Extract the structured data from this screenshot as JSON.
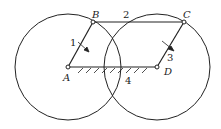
{
  "diagram": {
    "type": "four-bar linkage (parallelogram) with circles",
    "points": {
      "A": {
        "label": "A",
        "x": 68,
        "y": 67
      },
      "B": {
        "label": "B",
        "x": 93,
        "y": 22
      },
      "C": {
        "label": "C",
        "x": 184,
        "y": 22
      },
      "D": {
        "label": "D",
        "x": 157,
        "y": 67
      }
    },
    "links": [
      {
        "id": "1",
        "label": "1",
        "from": "A",
        "to": "B"
      },
      {
        "id": "2",
        "label": "2",
        "from": "B",
        "to": "C"
      },
      {
        "id": "3",
        "label": "3",
        "from": "D",
        "to": "C"
      },
      {
        "id": "4",
        "label": "4",
        "from": "A",
        "to": "D",
        "fixed": true
      }
    ],
    "circles": [
      {
        "center": "A",
        "r": 53
      },
      {
        "center": "D",
        "r": 53
      }
    ],
    "colors": {
      "stroke": "#222222",
      "background": "#ffffff"
    }
  }
}
